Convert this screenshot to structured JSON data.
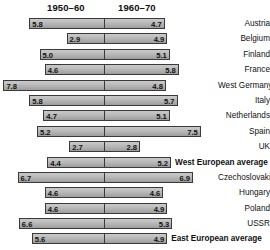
{
  "chart_data": {
    "type": "bar",
    "subtype": "diverging-paired-horizontal",
    "title": "",
    "xlabel": "",
    "ylabel": "",
    "grid": false,
    "legend_position": "top",
    "axis_center_value": 0,
    "px_per_unit": 12.9,
    "center_px": 104,
    "series": [
      {
        "name": "1950–60",
        "side": "left"
      },
      {
        "name": "1960–70",
        "side": "right"
      }
    ],
    "categories": [
      "Austria",
      "Belgium",
      "Finland",
      "France",
      "West Germany",
      "Italy",
      "Netherlands",
      "Spain",
      "UK",
      "West European average",
      "Czechoslovakia",
      "Hungary",
      "Poland",
      "USSR",
      "East European average"
    ],
    "rows": [
      {
        "category": "Austria",
        "left": 5.8,
        "right": 4.7,
        "emphasis": false
      },
      {
        "category": "Belgium",
        "left": 2.9,
        "right": 4.9,
        "emphasis": false
      },
      {
        "category": "Finland",
        "left": 5.0,
        "right": 5.1,
        "emphasis": false
      },
      {
        "category": "France",
        "left": 4.6,
        "right": 5.8,
        "emphasis": false
      },
      {
        "category": "West Germany",
        "left": 7.8,
        "right": 4.8,
        "emphasis": false
      },
      {
        "category": "Italy",
        "left": 5.8,
        "right": 5.7,
        "emphasis": false
      },
      {
        "category": "Netherlands",
        "left": 4.7,
        "right": 5.1,
        "emphasis": false
      },
      {
        "category": "Spain",
        "left": 5.2,
        "right": 7.5,
        "emphasis": false
      },
      {
        "category": "UK",
        "left": 2.7,
        "right": 2.8,
        "emphasis": false
      },
      {
        "category": "West European average",
        "left": 4.4,
        "right": 5.2,
        "emphasis": true
      },
      {
        "category": "Czechoslovakia",
        "left": 6.7,
        "right": 6.9,
        "emphasis": false
      },
      {
        "category": "Hungary",
        "left": 4.6,
        "right": 4.6,
        "emphasis": false
      },
      {
        "category": "Poland",
        "left": 4.6,
        "right": 4.9,
        "emphasis": false
      },
      {
        "category": "USSR",
        "left": 6.6,
        "right": 5.3,
        "emphasis": false
      },
      {
        "category": "East European average",
        "left": 5.6,
        "right": 4.9,
        "emphasis": true
      }
    ]
  },
  "header": {
    "period_left": "1950–60",
    "period_right": "1960–70"
  },
  "colors": {
    "bar_fill": "#bdbdbd",
    "bar_border": "#3a3a3a",
    "text": "#111111",
    "background": "#ffffff"
  }
}
